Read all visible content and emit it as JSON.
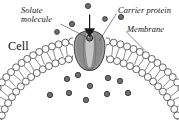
{
  "figure": {
    "width": 179,
    "height": 120,
    "background": "#ffffff"
  },
  "labels": {
    "solute_line1": "Solute",
    "solute_line2": "molecule",
    "carrier_protein": "Carrier protein",
    "membrane": "Membrane",
    "cell": "Cell"
  },
  "colors": {
    "ink": "#111111",
    "leader_line": "#4a4a4a",
    "membrane_head_fill": "#ffffff",
    "membrane_head_stroke": "#3a3a3a",
    "membrane_tail": "#707070",
    "protein_outline": "#4a4a4a",
    "protein_fill_dark": "#8c8c8c",
    "protein_fill_mid": "#a2a2a2",
    "protein_fill_light": "#c4c4c4",
    "solute_fill": "#6e6e6e",
    "solute_stroke": "#2a2a2a",
    "arrow": "#1a1a1a"
  },
  "diagram": {
    "type": "biology-cross-section",
    "structures": [
      {
        "name": "phospholipid-bilayer",
        "shape": "dome-arc",
        "leaflets": 2
      },
      {
        "name": "carrier-protein",
        "position": "membrane-apex",
        "state": "solute-bound"
      },
      {
        "name": "transport-arrow",
        "direction": "inward"
      }
    ],
    "solutes_outside_count": 5,
    "solutes_inside_count": 10,
    "solutes_in_channel_count": 1,
    "solutes_outside": [
      {
        "cx": 88,
        "cy": 6,
        "r": 2.6
      },
      {
        "cx": 121,
        "cy": 17,
        "r": 2.6
      },
      {
        "cx": 105,
        "cy": 19,
        "r": 2.4
      },
      {
        "cx": 72,
        "cy": 24,
        "r": 2.6
      },
      {
        "cx": 57,
        "cy": 32,
        "r": 2.4
      }
    ],
    "solutes_inside": [
      {
        "cx": 67,
        "cy": 79,
        "r": 2.7
      },
      {
        "cx": 78,
        "cy": 75,
        "r": 2.7
      },
      {
        "cx": 108,
        "cy": 78,
        "r": 2.7
      },
      {
        "cx": 120,
        "cy": 81,
        "r": 2.7
      },
      {
        "cx": 90,
        "cy": 86,
        "r": 2.7
      },
      {
        "cx": 50,
        "cy": 95,
        "r": 2.7
      },
      {
        "cx": 69,
        "cy": 93,
        "r": 2.7
      },
      {
        "cx": 86,
        "cy": 100,
        "r": 2.7
      },
      {
        "cx": 107,
        "cy": 94,
        "r": 2.7
      },
      {
        "cx": 128,
        "cy": 93,
        "r": 2.7
      }
    ],
    "leaders": [
      {
        "name": "solute-leader",
        "from": [
          60,
          25
        ],
        "to": [
          88,
          39
        ]
      },
      {
        "name": "carrier-leader",
        "from": [
          116,
          14
        ],
        "to": [
          98,
          41
        ]
      },
      {
        "name": "membrane-leader",
        "from": [
          126,
          31
        ],
        "to": [
          144,
          49
        ]
      }
    ]
  }
}
